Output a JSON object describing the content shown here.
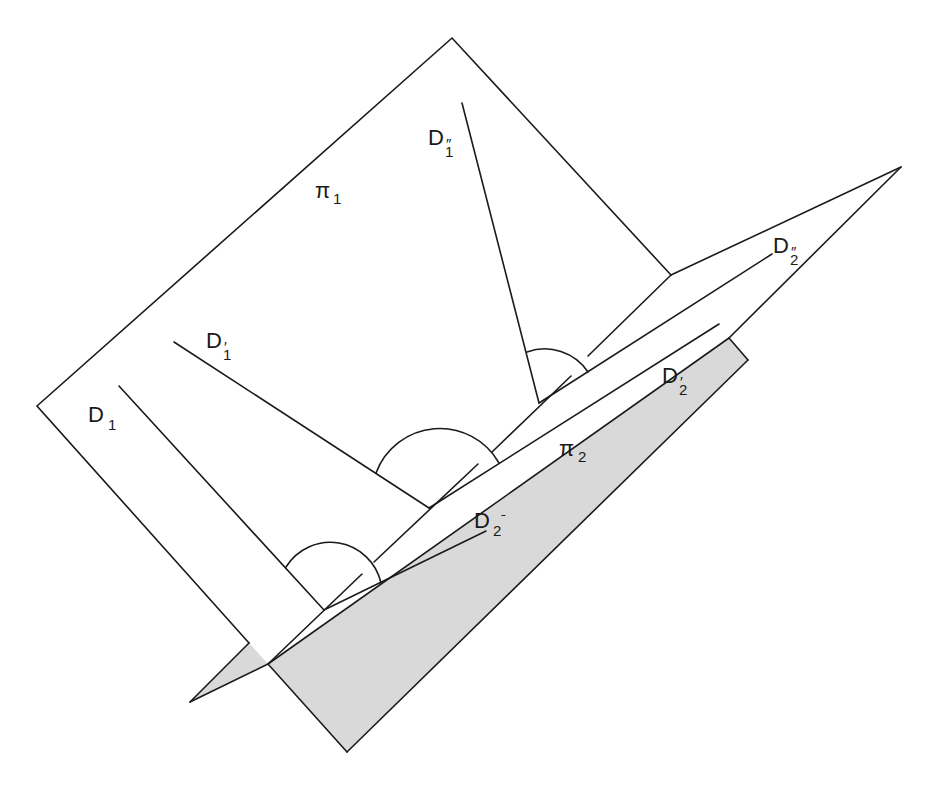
{
  "figure": {
    "colors": {
      "stroke": "#1a1a1a",
      "shade": "#d9d9d9",
      "background": "#ffffff"
    },
    "planes": [
      {
        "name": "π",
        "sub": "1"
      },
      {
        "name": "π",
        "sub": "2"
      }
    ],
    "lines_plane1": [
      {
        "name": "D",
        "sub": "1",
        "prime": ""
      },
      {
        "name": "D",
        "sub": "1",
        "prime": "′"
      },
      {
        "name": "D",
        "sub": "1",
        "prime": "″"
      }
    ],
    "lines_plane2": [
      {
        "name": "D",
        "sub": "2",
        "prime": "ˉ"
      },
      {
        "name": "D",
        "sub": "2",
        "prime": "′"
      },
      {
        "name": "D",
        "sub": "2",
        "prime": "″"
      }
    ]
  }
}
